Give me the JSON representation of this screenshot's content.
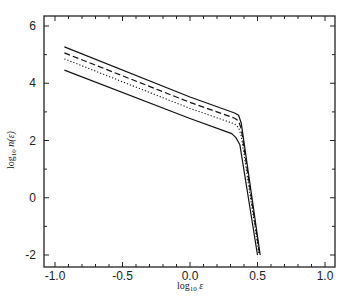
{
  "chart_data": {
    "type": "line",
    "title": "",
    "xlabel": "log₁₀ ε",
    "ylabel": "log₁₀ n(ε)",
    "xlim": [
      -1.07,
      1.08
    ],
    "ylim": [
      -2.4,
      6.35
    ],
    "xticks": [
      -1.0,
      -0.5,
      0.0,
      0.5,
      1.0
    ],
    "xtick_labels": [
      "-1.0",
      "-0.5",
      "0.0",
      "0.5",
      "1.0"
    ],
    "yticks": [
      -2,
      0,
      2,
      4,
      6
    ],
    "ytick_labels": [
      "-2",
      "0",
      "2",
      "4",
      "6"
    ],
    "grid": false,
    "legend": null,
    "series": [
      {
        "name": "solid-upper",
        "style": "solid",
        "x": [
          -0.93,
          0.0,
          0.33,
          0.36,
          0.38,
          0.52
        ],
        "y": [
          5.27,
          3.52,
          2.96,
          2.88,
          2.6,
          -2.0
        ]
      },
      {
        "name": "dashed",
        "style": "dashed",
        "x": [
          -0.93,
          0.0,
          0.33,
          0.36,
          0.38,
          0.515
        ],
        "y": [
          5.06,
          3.33,
          2.78,
          2.68,
          2.4,
          -1.95
        ]
      },
      {
        "name": "dotted",
        "style": "dotted",
        "x": [
          -0.93,
          0.0,
          0.33,
          0.36,
          0.38,
          0.51
        ],
        "y": [
          4.85,
          3.12,
          2.58,
          2.45,
          2.15,
          -1.95
        ]
      },
      {
        "name": "solid-lower",
        "style": "solid",
        "x": [
          -0.93,
          0.0,
          0.31,
          0.34,
          0.37,
          0.5
        ],
        "y": [
          4.46,
          2.77,
          2.24,
          2.1,
          1.85,
          -2.0
        ]
      }
    ]
  },
  "labels": {
    "xlabel_main": "log",
    "xlabel_sub": "10",
    "xlabel_var": " ε",
    "ylabel_main": "log",
    "ylabel_sub": "10",
    "ylabel_var": " n(ε)"
  }
}
